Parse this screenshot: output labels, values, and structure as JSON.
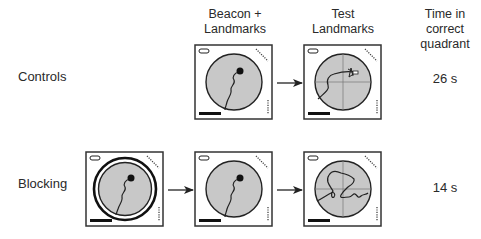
{
  "headers": {
    "beacon_landmarks": [
      "Beacon +",
      "Landmarks"
    ],
    "test_landmarks": [
      "Test",
      "Landmarks"
    ],
    "time": [
      "Time in",
      "correct",
      "quadrant"
    ]
  },
  "rows": [
    {
      "label": "Controls",
      "time": "26 s",
      "panels": [
        "beacon-landmarks-training",
        "test-landmarks-probe"
      ]
    },
    {
      "label": "Blocking",
      "time": "14 s",
      "panels": [
        "beacon-only-curtained-training",
        "beacon-landmarks-training",
        "test-landmarks-probe"
      ]
    }
  ],
  "colors": {
    "pool_fill": "#c8c8c8",
    "line": "#222222",
    "background": "#ffffff"
  }
}
